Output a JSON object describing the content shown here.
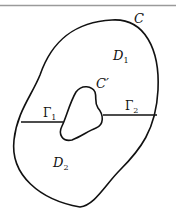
{
  "figure": {
    "outer_curve_label": "C",
    "inner_curve_label": "C′",
    "region_upper_label": "D",
    "region_upper_sub": "1",
    "region_lower_label": "D",
    "region_lower_sub": "2",
    "cut_left_label": "Γ",
    "cut_left_sub": "1",
    "cut_right_label": "Γ",
    "cut_right_sub": "2"
  },
  "colors": {
    "stroke": "#111111",
    "top_rule": "#9a9a9a"
  }
}
